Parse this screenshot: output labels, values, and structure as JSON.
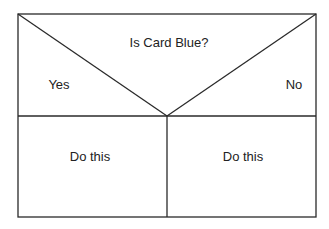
{
  "diagram": {
    "type": "decision-table",
    "question": "Is Card Blue?",
    "branches": [
      {
        "label": "Yes",
        "action": "Do this"
      },
      {
        "label": "No",
        "action": "Do this"
      }
    ],
    "colors": {
      "line": "#2a2a2a",
      "text": "#222222",
      "background": "#ffffff"
    }
  }
}
